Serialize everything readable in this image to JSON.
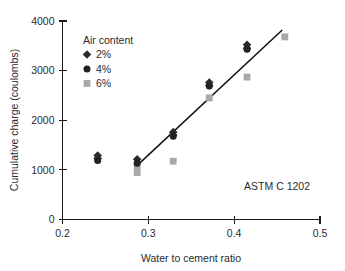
{
  "chart_data": {
    "type": "scatter",
    "title": "",
    "xlabel": "Water to cement ratio",
    "ylabel": "Cumulative charge (coulombs)",
    "xlim": [
      0.2,
      0.5
    ],
    "ylim": [
      0,
      4000
    ],
    "xticks": [
      "0.2",
      "0.3",
      "0.4",
      "0.5"
    ],
    "xtick_values": [
      0.2,
      0.3,
      0.4,
      0.5
    ],
    "yticks": [
      "0",
      "1000",
      "2000",
      "3000",
      "4000"
    ],
    "ytick_values": [
      0,
      1000,
      2000,
      3000,
      4000
    ],
    "grid": false,
    "legend_position": "upper-left-inside",
    "legend_title": "Air content",
    "annotation": "ASTM C 1202",
    "series": [
      {
        "name": "2%",
        "marker": "diamond",
        "color": "#2b2b2b",
        "points": [
          {
            "x": 0.241,
            "y": 1290
          },
          {
            "x": 0.241,
            "y": 1230
          },
          {
            "x": 0.287,
            "y": 1215
          },
          {
            "x": 0.329,
            "y": 1760
          },
          {
            "x": 0.329,
            "y": 1700
          },
          {
            "x": 0.371,
            "y": 2760
          },
          {
            "x": 0.371,
            "y": 2700
          },
          {
            "x": 0.415,
            "y": 3520
          },
          {
            "x": 0.415,
            "y": 3450
          }
        ]
      },
      {
        "name": "4%",
        "marker": "circle",
        "color": "#222222",
        "points": [
          {
            "x": 0.241,
            "y": 1190
          },
          {
            "x": 0.287,
            "y": 1135
          },
          {
            "x": 0.329,
            "y": 1680
          },
          {
            "x": 0.371,
            "y": 2690
          },
          {
            "x": 0.415,
            "y": 3430
          }
        ]
      },
      {
        "name": "6%",
        "marker": "square",
        "color": "#a8a8a8",
        "points": [
          {
            "x": 0.287,
            "y": 1075
          },
          {
            "x": 0.287,
            "y": 945
          },
          {
            "x": 0.329,
            "y": 1175
          },
          {
            "x": 0.371,
            "y": 2450
          },
          {
            "x": 0.415,
            "y": 2870
          },
          {
            "x": 0.459,
            "y": 3680
          }
        ]
      }
    ],
    "trend_line": {
      "x_start": 0.284,
      "y_start": 1040,
      "x_end": 0.456,
      "y_end": 3820
    }
  },
  "legend": {
    "title": "Air content",
    "entries": [
      {
        "label": "2%",
        "marker": "diamond"
      },
      {
        "label": "4%",
        "marker": "circle"
      },
      {
        "label": "6%",
        "marker": "square"
      }
    ]
  },
  "axes": {
    "x_title": "Water to cement ratio",
    "y_title": "Cumulative charge (coulombs)",
    "x_tick_labels": [
      "0.2",
      "0.3",
      "0.4",
      "0.5"
    ],
    "y_tick_labels": [
      "0",
      "1000",
      "2000",
      "3000",
      "4000"
    ]
  },
  "annotation": {
    "text": "ASTM C 1202"
  },
  "colors": {
    "marker_dark": "#2b2b2b",
    "marker_gray": "#a8a8a8",
    "axis": "#1a1a1a",
    "text": "#2b2b2b",
    "background": "#ffffff"
  }
}
